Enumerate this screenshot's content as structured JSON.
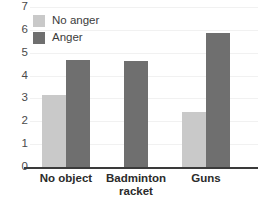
{
  "chart_data": {
    "type": "bar",
    "title": "",
    "xlabel": "",
    "ylabel": "",
    "ylim": [
      0,
      7
    ],
    "yticks": [
      0,
      1,
      2,
      3,
      4,
      5,
      6,
      7
    ],
    "ytick_labels": [
      "0",
      "1",
      "2",
      "3",
      "4",
      "5",
      "6",
      "7"
    ],
    "grid": true,
    "legend_position": "top-left",
    "categories": [
      "No object",
      "Badminton racket",
      "Guns"
    ],
    "category_lines": [
      [
        "No object"
      ],
      [
        "Badminton",
        "racket"
      ],
      [
        "Guns"
      ]
    ],
    "series": [
      {
        "name": "No anger",
        "color": "#c9c9c9",
        "values": [
          3.15,
          null,
          2.4
        ]
      },
      {
        "name": "Anger",
        "color": "#6f6f6f",
        "values": [
          4.7,
          4.65,
          5.85
        ]
      }
    ]
  },
  "legend": {
    "items": [
      {
        "label": "No anger",
        "swatch": "light"
      },
      {
        "label": "Anger",
        "swatch": "dark"
      }
    ]
  },
  "colors": {
    "no_anger": "#c9c9c9",
    "anger": "#6f6f6f",
    "axis": "#3a3a3a",
    "grid": "#f1f1f1",
    "tick_text": "#4a4a4a",
    "category_text": "#2b2b2b",
    "background": "#ffffff"
  }
}
